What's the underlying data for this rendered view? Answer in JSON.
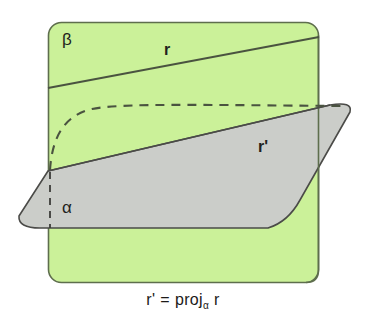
{
  "figure": {
    "caption": {
      "lhs": "r'",
      "equals": "=",
      "operator": "proj",
      "subscript": "α",
      "argument": "r"
    },
    "labels": {
      "plane_beta": "β",
      "plane_alpha": "α",
      "line_r": "r",
      "line_r_prime": "r'"
    },
    "colors": {
      "plane_beta_fill": "#cbf199",
      "plane_beta_stroke": "#5b6b4a",
      "plane_alpha_fill": "#cbcdc9",
      "plane_alpha_stroke": "#4b4b48",
      "line_stroke": "#4a5340",
      "dashed_stroke": "#4a5340",
      "text_color": "#221f1c",
      "background": "#ffffff"
    },
    "geometry": {
      "plane_beta_rect": {
        "x": 48,
        "y": 22,
        "width": 271,
        "height": 261,
        "corner_radius": 13
      },
      "plane_alpha_points": "48,171 350,105 268,229 28,229",
      "line_r_from": [
        48,
        88
      ],
      "line_r_to": [
        319,
        37
      ],
      "line_r_prime_from": [
        48,
        171
      ],
      "line_r_prime_to": [
        350,
        106
      ],
      "alpha_vertical_dash_x": 50,
      "alpha_vertical_dash_from_y": 171,
      "alpha_vertical_dash_to_y": 229
    }
  }
}
